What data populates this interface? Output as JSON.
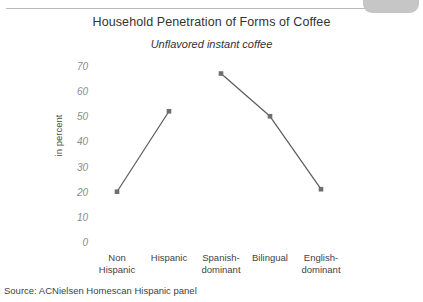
{
  "decoration": {
    "top_tab_color": "#c6c6c6",
    "top_rule_color": "#b9b9b9"
  },
  "source_note": "Source: ACNielsen Homescan Hispanic panel",
  "chart_data": {
    "type": "line",
    "title": "Household Penetration of Forms of Coffee",
    "subtitle": "Unflavored instant coffee",
    "xlabel": "",
    "ylabel": "in percent",
    "categories": [
      "Non\nHispanic",
      "Hispanic",
      "Spanish-\ndominant",
      "Bilingual",
      "English-\ndominant"
    ],
    "category_lines": [
      [
        "Non",
        "Hispanic"
      ],
      [
        "Hispanic",
        ""
      ],
      [
        "Spanish-",
        "dominant"
      ],
      [
        "Bilingual",
        ""
      ],
      [
        "English-",
        "dominant"
      ]
    ],
    "values": [
      20,
      52,
      67,
      50,
      21
    ],
    "series": [
      {
        "name": "Unflavored instant coffee",
        "values": [
          20,
          52,
          67,
          50,
          21
        ],
        "color": "#5a5a5a",
        "marker": "square",
        "marker_color": "#6e6e6e",
        "segments": [
          {
            "from": 0,
            "to": 1,
            "connected": true
          },
          {
            "from": 1,
            "to": 2,
            "connected": false
          },
          {
            "from": 2,
            "to": 3,
            "connected": true
          },
          {
            "from": 3,
            "to": 4,
            "connected": true
          }
        ]
      }
    ],
    "ylim": [
      0,
      70
    ],
    "yticks": [
      70,
      60,
      50,
      40,
      30,
      20,
      10,
      0
    ],
    "ytick_labels": [
      "70",
      "60",
      "50",
      "40",
      "30",
      "20",
      "10",
      "0"
    ],
    "grid": false,
    "legend": "none",
    "axis_lines": false
  }
}
